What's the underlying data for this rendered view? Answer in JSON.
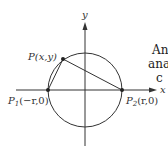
{
  "diagram": {
    "axes": {
      "x_label": "x",
      "y_label": "y"
    },
    "points": {
      "p": {
        "label": "P(x,y)"
      },
      "p1": {
        "label": "P",
        "sub": "1",
        "coords": "(−r,0)"
      },
      "p2": {
        "label": "P",
        "sub": "2",
        "coords": "(r,0)"
      }
    },
    "colors": {
      "stroke": "#333333",
      "background": "#ffffff"
    }
  },
  "side_text": {
    "line1": "An",
    "line2": "ana",
    "line3": "c"
  }
}
